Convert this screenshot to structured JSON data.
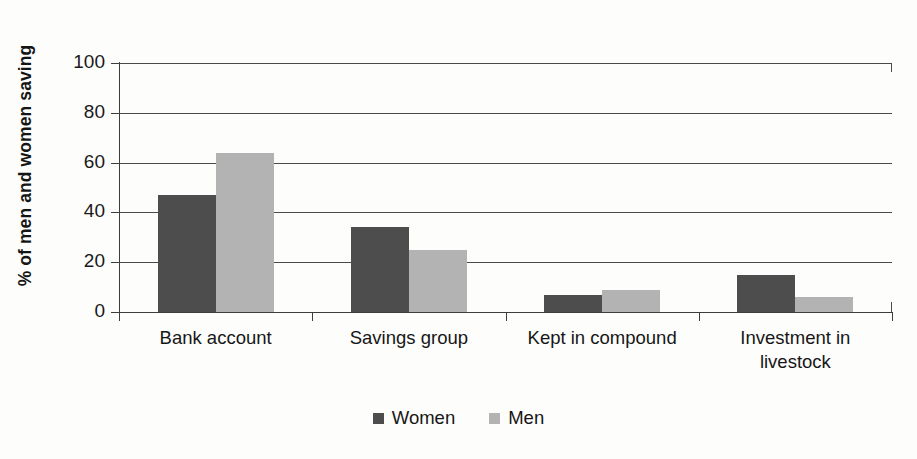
{
  "chart_data": {
    "type": "bar",
    "title": "",
    "subtitle": "",
    "xlabel": "",
    "ylabel": "% of men and women saving",
    "ylim": [
      0,
      100
    ],
    "ytick_labels": [
      "100",
      "80",
      "60",
      "40",
      "20",
      "0"
    ],
    "ytick_values": [
      100,
      80,
      60,
      40,
      20,
      0
    ],
    "grid": true,
    "legend_position": "bottom-center",
    "categories": [
      "Bank account",
      "Savings group",
      "Kept in compound",
      "Investment in livestock"
    ],
    "category_lines": [
      [
        "Bank account"
      ],
      [
        "Savings group"
      ],
      [
        "Kept in compound"
      ],
      [
        "Investment in",
        "livestock"
      ]
    ],
    "series": [
      {
        "name": "Women",
        "color": "#4d4d4d",
        "values": [
          47,
          34,
          7,
          15
        ]
      },
      {
        "name": "Men",
        "color": "#b3b3b3",
        "values": [
          64,
          25,
          9,
          6
        ]
      }
    ]
  },
  "colors": {
    "women": "#4d4d4d",
    "men": "#b3b3b3",
    "axis": "#3d3d3d",
    "gridline": "#4a4a4a",
    "background": "#fdfdfc",
    "text": "#161616"
  }
}
